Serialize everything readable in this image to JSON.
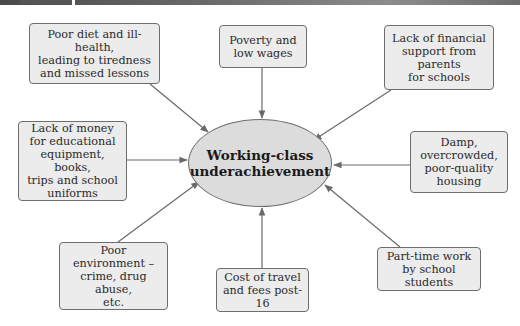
{
  "diagram": {
    "type": "spider-diagram",
    "center": {
      "label": "Working-class\nunderachievement"
    },
    "factors": [
      {
        "id": "poor-diet",
        "label": "Poor diet and ill-health,\nleading to tiredness\nand missed lessons"
      },
      {
        "id": "poverty",
        "label": "Poverty and\nlow wages"
      },
      {
        "id": "financial-support",
        "label": "Lack of financial\nsupport from\nparents\nfor schools"
      },
      {
        "id": "lack-of-money",
        "label": "Lack of money\nfor educational\nequipment, books,\ntrips and school\nuniforms"
      },
      {
        "id": "housing",
        "label": "Damp,\novercrowded,\npoor-quality\nhousing"
      },
      {
        "id": "poor-environment",
        "label": "Poor\nenvironment –\ncrime, drug abuse,\netc."
      },
      {
        "id": "cost-of-travel",
        "label": "Cost of travel\nand fees post-16"
      },
      {
        "id": "part-time-work",
        "label": "Part-time work\nby school students"
      }
    ],
    "edges": [
      {
        "from": "poor-diet",
        "to": "center"
      },
      {
        "from": "poverty",
        "to": "center"
      },
      {
        "from": "financial-support",
        "to": "center"
      },
      {
        "from": "lack-of-money",
        "to": "center"
      },
      {
        "from": "housing",
        "to": "center"
      },
      {
        "from": "poor-environment",
        "to": "center"
      },
      {
        "from": "cost-of-travel",
        "to": "center"
      },
      {
        "from": "part-time-work",
        "to": "center"
      }
    ],
    "colors": {
      "box_fill": "#ececec",
      "ellipse_fill": "#dcdcdc",
      "stroke": "#6d6d6d",
      "arrow": "#6a6a6a"
    }
  }
}
